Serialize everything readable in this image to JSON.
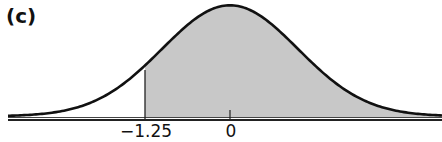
{
  "panel": {
    "label": "(c)"
  },
  "colors": {
    "curve": "#111111",
    "shade": "#c8c8c8",
    "axis": "#222222"
  },
  "chart_data": {
    "type": "area",
    "title": "(c)",
    "distribution": "standard normal",
    "xlabel": "",
    "ylabel": "",
    "tick_labels": [
      "-1.25",
      "0"
    ],
    "ticks": [
      -1.25,
      0
    ],
    "shaded_region": {
      "from": -1.25,
      "to": "+inf"
    },
    "xlim": [
      -3.4,
      3.1
    ],
    "grid": false,
    "legend": null
  },
  "ticks": {
    "t1": "−1.25",
    "t2": "0"
  }
}
